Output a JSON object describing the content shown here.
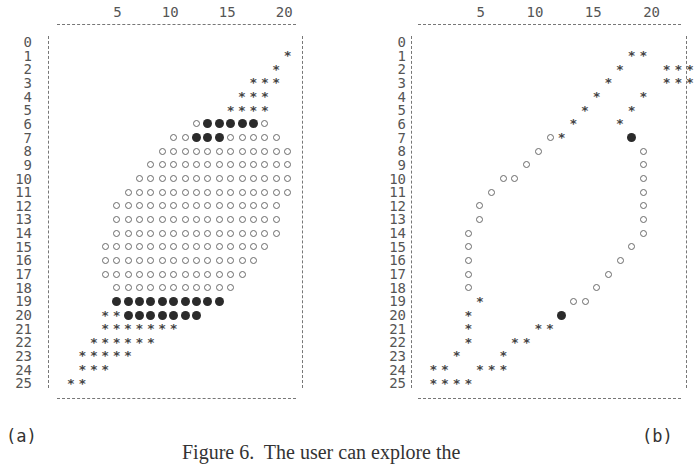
{
  "figure": {
    "caption": "Figure 6.  The user can explore the",
    "panels": [
      {
        "id": "a",
        "label": "(a)",
        "col_ticks": [
          "5",
          "10",
          "15",
          "20"
        ],
        "row_labels": [
          "0",
          "1",
          "2",
          "3",
          "4",
          "5",
          "6",
          "7",
          "8",
          "9",
          "10",
          "11",
          "12",
          "13",
          "14",
          "15",
          "16",
          "17",
          "18",
          "19",
          "20",
          "21",
          "22",
          "23",
          "24",
          "25"
        ]
      },
      {
        "id": "b",
        "label": "(b)",
        "col_ticks": [
          "5",
          "10",
          "15",
          "20"
        ],
        "row_labels": [
          "0",
          "1",
          "2",
          "3",
          "4",
          "5",
          "6",
          "7",
          "8",
          "9",
          "10",
          "11",
          "12",
          "13",
          "14",
          "15",
          "16",
          "17",
          "18",
          "19",
          "20",
          "21",
          "22",
          "23",
          "24",
          "25"
        ]
      }
    ],
    "legend_symbols": {
      "*": "star",
      "o": "open-circle",
      "@": "filled-circle"
    }
  },
  "chart_data": [
    {
      "type": "table",
      "title": "(a)",
      "grid_rows": 26,
      "grid_cols_range": [
        1,
        20
      ],
      "row_strings": {
        "1": {
          "start": 20,
          "cells": "*"
        },
        "2": {
          "start": 19,
          "cells": "*"
        },
        "3": {
          "start": 17,
          "cells": "***"
        },
        "4": {
          "start": 16,
          "cells": "***"
        },
        "5": {
          "start": 15,
          "cells": "****"
        },
        "6": {
          "start": 12,
          "cells": "o@@@@@o"
        },
        "7": {
          "start": 10,
          "cells": "oo@@@ooooo"
        },
        "8": {
          "start": 9,
          "cells": "oooooooooooo"
        },
        "9": {
          "start": 8,
          "cells": "ooooooooooooo"
        },
        "10": {
          "start": 7,
          "cells": "oooooooooooooo"
        },
        "11": {
          "start": 6,
          "cells": "ooooooooooooooo"
        },
        "12": {
          "start": 5,
          "cells": "ooooooooooooooo"
        },
        "13": {
          "start": 5,
          "cells": "ooooooooooooooo"
        },
        "14": {
          "start": 5,
          "cells": "ooooooooooooooo"
        },
        "15": {
          "start": 4,
          "cells": "ooooooooooooooo"
        },
        "16": {
          "start": 4,
          "cells": "oooooooooooooo"
        },
        "17": {
          "start": 4,
          "cells": "ooooooooooooo"
        },
        "18": {
          "start": 5,
          "cells": "ooooooooooo"
        },
        "19": {
          "start": 5,
          "cells": "@@@@@@@@@@"
        },
        "20": {
          "start": 4,
          "cells": "**@@@@@@@"
        },
        "21": {
          "start": 4,
          "cells": "*******"
        },
        "22": {
          "start": 3,
          "cells": "******"
        },
        "23": {
          "start": 2,
          "cells": "*****"
        },
        "24": {
          "start": 2,
          "cells": "***"
        },
        "25": {
          "start": 1,
          "cells": "**"
        }
      }
    },
    {
      "type": "table",
      "title": "(b)",
      "grid_rows": 26,
      "grid_cols_range": [
        1,
        23
      ],
      "points": [
        [
          1,
          18,
          "*"
        ],
        [
          1,
          19,
          "*"
        ],
        [
          2,
          17,
          "*"
        ],
        [
          2,
          21,
          "*"
        ],
        [
          2,
          22,
          "*"
        ],
        [
          2,
          23,
          "*"
        ],
        [
          3,
          16,
          "*"
        ],
        [
          3,
          21,
          "*"
        ],
        [
          3,
          22,
          "*"
        ],
        [
          3,
          23,
          "*"
        ],
        [
          4,
          15,
          "*"
        ],
        [
          4,
          19,
          "*"
        ],
        [
          5,
          14,
          "*"
        ],
        [
          5,
          18,
          "*"
        ],
        [
          6,
          13,
          "*"
        ],
        [
          6,
          17,
          "*"
        ],
        [
          7,
          11,
          "o"
        ],
        [
          7,
          12,
          "*"
        ],
        [
          7,
          18,
          "@"
        ],
        [
          8,
          10,
          "o"
        ],
        [
          8,
          19,
          "o"
        ],
        [
          9,
          9,
          "o"
        ],
        [
          9,
          19,
          "o"
        ],
        [
          10,
          7,
          "o"
        ],
        [
          10,
          8,
          "o"
        ],
        [
          10,
          19,
          "o"
        ],
        [
          11,
          6,
          "o"
        ],
        [
          11,
          19,
          "o"
        ],
        [
          12,
          5,
          "o"
        ],
        [
          12,
          19,
          "o"
        ],
        [
          13,
          5,
          "o"
        ],
        [
          13,
          19,
          "o"
        ],
        [
          14,
          4,
          "o"
        ],
        [
          14,
          19,
          "o"
        ],
        [
          15,
          4,
          "o"
        ],
        [
          15,
          18,
          "o"
        ],
        [
          16,
          4,
          "o"
        ],
        [
          16,
          17,
          "o"
        ],
        [
          17,
          4,
          "o"
        ],
        [
          17,
          16,
          "o"
        ],
        [
          18,
          4,
          "o"
        ],
        [
          18,
          15,
          "o"
        ],
        [
          19,
          5,
          "*"
        ],
        [
          19,
          13,
          "o"
        ],
        [
          19,
          14,
          "o"
        ],
        [
          20,
          4,
          "*"
        ],
        [
          20,
          12,
          "@"
        ],
        [
          21,
          4,
          "*"
        ],
        [
          21,
          10,
          "*"
        ],
        [
          21,
          11,
          "*"
        ],
        [
          22,
          4,
          "*"
        ],
        [
          22,
          8,
          "*"
        ],
        [
          22,
          9,
          "*"
        ],
        [
          23,
          3,
          "*"
        ],
        [
          23,
          7,
          "*"
        ],
        [
          24,
          1,
          "*"
        ],
        [
          24,
          2,
          "*"
        ],
        [
          24,
          5,
          "*"
        ],
        [
          24,
          6,
          "*"
        ],
        [
          24,
          7,
          "*"
        ],
        [
          25,
          1,
          "*"
        ],
        [
          25,
          2,
          "*"
        ],
        [
          25,
          3,
          "*"
        ],
        [
          25,
          4,
          "*"
        ]
      ]
    }
  ]
}
